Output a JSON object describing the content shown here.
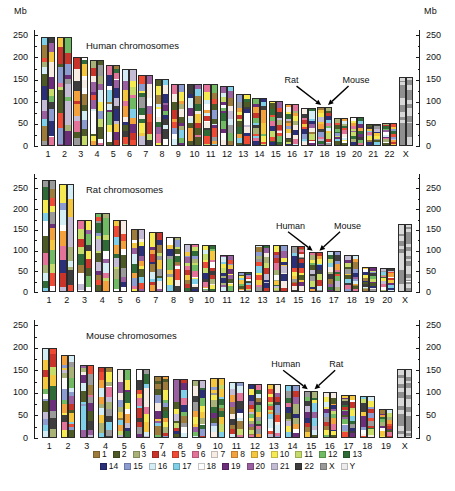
{
  "figure": {
    "unit_label_left": "Mb",
    "unit_label_right": "Mb"
  },
  "panels": [
    {
      "id": "human",
      "title": "Human chromosomes",
      "axis": {
        "min": 0,
        "max": 262,
        "ticks": [
          0,
          50,
          100,
          150,
          200,
          250
        ],
        "unit": "Mb"
      },
      "annotations": [
        {
          "label": "Rat",
          "target_chrom": "18",
          "target_side": "left"
        },
        {
          "label": "Mouse",
          "target_chrom": "18",
          "target_side": "right"
        }
      ],
      "categories": [
        "1",
        "2",
        "3",
        "4",
        "5",
        "6",
        "7",
        "8",
        "9",
        "10",
        "11",
        "12",
        "13",
        "14",
        "15",
        "16",
        "17",
        "18",
        "19",
        "20",
        "21",
        "22",
        "X"
      ],
      "lengths": [
        247,
        247,
        202,
        195,
        184,
        173,
        160,
        151,
        139,
        139,
        139,
        135,
        118,
        108,
        102,
        94,
        86,
        89,
        63,
        65,
        50,
        52,
        155
      ]
    },
    {
      "id": "rat",
      "title": "Rat chromosomes",
      "axis": {
        "min": 0,
        "max": 285,
        "ticks": [
          0,
          50,
          100,
          150,
          200,
          250
        ],
        "unit": "Mb"
      },
      "annotations": [
        {
          "label": "Human",
          "target_chrom": "16",
          "target_side": "left"
        },
        {
          "label": "Mouse",
          "target_chrom": "16",
          "target_side": "right"
        }
      ],
      "categories": [
        "1",
        "2",
        "3",
        "4",
        "5",
        "6",
        "7",
        "8",
        "9",
        "10",
        "11",
        "12",
        "13",
        "14",
        "15",
        "16",
        "17",
        "18",
        "19",
        "20",
        "X"
      ],
      "lengths": [
        270,
        262,
        174,
        192,
        175,
        151,
        146,
        132,
        115,
        114,
        90,
        49,
        113,
        113,
        111,
        96,
        100,
        90,
        61,
        58,
        164
      ]
    },
    {
      "id": "mouse",
      "title": "Mouse chromosomes",
      "axis": {
        "min": 0,
        "max": 262,
        "ticks": [
          0,
          50,
          100,
          150,
          200,
          250
        ],
        "unit": "Mb"
      },
      "annotations": [
        {
          "label": "Human",
          "target_chrom": "15",
          "target_side": "left"
        },
        {
          "label": "Rat",
          "target_chrom": "15",
          "target_side": "right"
        }
      ],
      "categories": [
        "1",
        "2",
        "3",
        "4",
        "5",
        "6",
        "7",
        "8",
        "9",
        "10",
        "11",
        "12",
        "13",
        "14",
        "15",
        "16",
        "17",
        "18",
        "19",
        "X"
      ],
      "lengths": [
        199,
        184,
        163,
        157,
        153,
        153,
        138,
        131,
        128,
        134,
        125,
        120,
        120,
        118,
        105,
        103,
        96,
        94,
        64,
        153
      ]
    }
  ],
  "legend": {
    "rows": [
      [
        {
          "label": "1",
          "color": "#9c7b3b"
        },
        {
          "label": "2",
          "color": "#4e5a26"
        },
        {
          "label": "3",
          "color": "#a8b277"
        },
        {
          "label": "4",
          "color": "#c9342a"
        },
        {
          "label": "5",
          "color": "#ef4a33"
        },
        {
          "label": "6",
          "color": "#e4739a"
        },
        {
          "label": "7",
          "color": "#f7ece4"
        },
        {
          "label": "8",
          "color": "#f2a13c"
        },
        {
          "label": "9",
          "color": "#f5c73e"
        },
        {
          "label": "10",
          "color": "#f6ea52"
        },
        {
          "label": "11",
          "color": "#c6dc6a"
        },
        {
          "label": "12",
          "color": "#6fba62"
        },
        {
          "label": "13",
          "color": "#2f6b36"
        }
      ],
      [
        {
          "label": "14",
          "color": "#2b2f78"
        },
        {
          "label": "15",
          "color": "#8c9bd0"
        },
        {
          "label": "16",
          "color": "#d4ecf4"
        },
        {
          "label": "17",
          "color": "#7fcfe8"
        },
        {
          "label": "18",
          "color": "#fdfdfd"
        },
        {
          "label": "19",
          "color": "#6c2d7a"
        },
        {
          "label": "20",
          "color": "#9a5fa0"
        },
        {
          "label": "21",
          "color": "#c3bcd4"
        },
        {
          "label": "22",
          "color": "#3d3d3d"
        },
        {
          "label": "X",
          "color": "#9a9a9a"
        },
        {
          "label": "Y",
          "color": "#ececec"
        }
      ]
    ]
  },
  "chart_data": {
    "type": "bar",
    "ylabel": "Mb",
    "xlabel": "",
    "grid": false,
    "legend_position": "bottom",
    "note": "Each chromosome is drawn as a pair of adjacent ideogram columns; coloured segments mark blocks of conserved synteny whose colour indicates the corresponding chromosome in the comparison species (see legend). X chromosomes are shown with grey banding.",
    "palette": {
      "1": "#9c7b3b",
      "2": "#4e5a26",
      "3": "#a8b277",
      "4": "#c9342a",
      "5": "#ef4a33",
      "6": "#e4739a",
      "7": "#f7ece4",
      "8": "#f2a13c",
      "9": "#f5c73e",
      "10": "#f6ea52",
      "11": "#c6dc6a",
      "12": "#6fba62",
      "13": "#2f6b36",
      "14": "#2b2f78",
      "15": "#8c9bd0",
      "16": "#d4ecf4",
      "17": "#7fcfe8",
      "18": "#fdfdfd",
      "19": "#6c2d7a",
      "20": "#9a5fa0",
      "21": "#c3bcd4",
      "22": "#3d3d3d",
      "X": "#9a9a9a",
      "Y": "#ececec"
    },
    "panels": [
      {
        "name": "Human chromosomes",
        "ylim": [
          0,
          262
        ],
        "yticks": [
          0,
          50,
          100,
          150,
          200,
          250
        ],
        "categories": [
          "1",
          "2",
          "3",
          "4",
          "5",
          "6",
          "7",
          "8",
          "9",
          "10",
          "11",
          "12",
          "13",
          "14",
          "15",
          "16",
          "17",
          "18",
          "19",
          "20",
          "21",
          "22",
          "X"
        ],
        "values": [
          247,
          247,
          202,
          195,
          184,
          173,
          160,
          151,
          139,
          139,
          139,
          135,
          118,
          108,
          102,
          94,
          86,
          89,
          63,
          65,
          50,
          52,
          155
        ],
        "annotations": [
          "Rat",
          "Mouse"
        ]
      },
      {
        "name": "Rat chromosomes",
        "ylim": [
          0,
          285
        ],
        "yticks": [
          0,
          50,
          100,
          150,
          200,
          250
        ],
        "categories": [
          "1",
          "2",
          "3",
          "4",
          "5",
          "6",
          "7",
          "8",
          "9",
          "10",
          "11",
          "12",
          "13",
          "14",
          "15",
          "16",
          "17",
          "18",
          "19",
          "20",
          "X"
        ],
        "values": [
          270,
          262,
          174,
          192,
          175,
          151,
          146,
          132,
          115,
          114,
          90,
          49,
          113,
          113,
          111,
          96,
          100,
          90,
          61,
          58,
          164
        ],
        "annotations": [
          "Human",
          "Mouse"
        ]
      },
      {
        "name": "Mouse chromosomes",
        "ylim": [
          0,
          262
        ],
        "yticks": [
          0,
          50,
          100,
          150,
          200,
          250
        ],
        "categories": [
          "1",
          "2",
          "3",
          "4",
          "5",
          "6",
          "7",
          "8",
          "9",
          "10",
          "11",
          "12",
          "13",
          "14",
          "15",
          "16",
          "17",
          "18",
          "19",
          "X"
        ],
        "values": [
          199,
          184,
          163,
          157,
          153,
          153,
          138,
          131,
          128,
          134,
          125,
          120,
          120,
          118,
          105,
          103,
          96,
          94,
          64,
          153
        ],
        "annotations": [
          "Human",
          "Rat"
        ]
      }
    ]
  }
}
